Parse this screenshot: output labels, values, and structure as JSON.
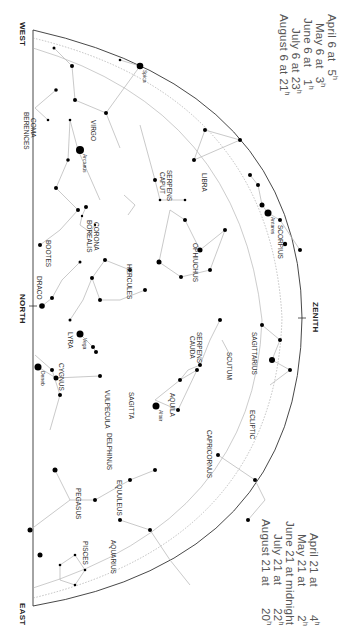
{
  "times_top": [
    {
      "label": "April 6 at",
      "value": "5",
      "unit": "h"
    },
    {
      "label": "May 6 at",
      "value": "3",
      "unit": "h"
    },
    {
      "label": "June 6 at",
      "value": "1",
      "unit": "h"
    },
    {
      "label": "July 6 at",
      "value": "23",
      "unit": "h"
    },
    {
      "label": "August 6 at",
      "value": "21",
      "unit": "h"
    }
  ],
  "times_bottom": [
    {
      "label": "April 21 at",
      "value": "4",
      "unit": "h"
    },
    {
      "label": "May 21 at",
      "value": "2",
      "unit": "h"
    },
    {
      "label": "June 21 at midnight",
      "value": "",
      "unit": ""
    },
    {
      "label": "July 21 at",
      "value": "22",
      "unit": "h"
    },
    {
      "label": "August 21 at",
      "value": "20",
      "unit": "h"
    }
  ],
  "compass": {
    "west": "WEST",
    "north": "NORTH",
    "east": "EAST",
    "zenith": "ZENITH"
  },
  "constellations": [
    {
      "name": "COMA",
      "x": 37,
      "y": 118
    },
    {
      "name": "BERENICES",
      "x": 30,
      "y": 112
    },
    {
      "name": "VIRGO",
      "x": 97,
      "y": 120
    },
    {
      "name": "BOOTES",
      "x": 52,
      "y": 240
    },
    {
      "name": "SERPENS",
      "x": 173,
      "y": 170
    },
    {
      "name": "CAPUT",
      "x": 166,
      "y": 172
    },
    {
      "name": "LIBRA",
      "x": 208,
      "y": 173
    },
    {
      "name": "CORONA",
      "x": 100,
      "y": 222
    },
    {
      "name": "BOREALIS",
      "x": 93,
      "y": 220
    },
    {
      "name": "OPHIUCHUS",
      "x": 199,
      "y": 243
    },
    {
      "name": "SCORPIUS",
      "x": 284,
      "y": 225
    },
    {
      "name": "HERCULES",
      "x": 133,
      "y": 264
    },
    {
      "name": "DRACO",
      "x": 43,
      "y": 276
    },
    {
      "name": "SERPENS",
      "x": 203,
      "y": 332
    },
    {
      "name": "CAUDA",
      "x": 196,
      "y": 336
    },
    {
      "name": "SAGITTARIUS",
      "x": 258,
      "y": 332
    },
    {
      "name": "SCUTUM",
      "x": 233,
      "y": 352
    },
    {
      "name": "LYRA",
      "x": 74,
      "y": 332
    },
    {
      "name": "CYGNUS",
      "x": 65,
      "y": 363
    },
    {
      "name": "VULPECULA",
      "x": 111,
      "y": 390
    },
    {
      "name": "SAGITTA",
      "x": 135,
      "y": 392
    },
    {
      "name": "AQUILA",
      "x": 176,
      "y": 393
    },
    {
      "name": "ECLIPTIC",
      "x": 256,
      "y": 410
    },
    {
      "name": "CAPRICORNUS",
      "x": 213,
      "y": 430
    },
    {
      "name": "DELPHINUS",
      "x": 113,
      "y": 433
    },
    {
      "name": "EQUULEUS",
      "x": 123,
      "y": 480
    },
    {
      "name": "PEGASUS",
      "x": 82,
      "y": 488
    },
    {
      "name": "AQUARIUS",
      "x": 117,
      "y": 540
    },
    {
      "name": "PISCES",
      "x": 89,
      "y": 541
    }
  ],
  "stars": [
    {
      "name": "Spica",
      "x": 140,
      "y": 66
    },
    {
      "name": "Arcturus",
      "x": 80,
      "y": 150
    },
    {
      "name": "Antares",
      "x": 268,
      "y": 213
    },
    {
      "name": "Vega",
      "x": 80,
      "y": 334
    },
    {
      "name": "Deneb",
      "x": 38,
      "y": 367
    },
    {
      "name": "Altair",
      "x": 156,
      "y": 406
    }
  ],
  "ecliptic_degrees": [
    "180°",
    "190°",
    "200°",
    "210°",
    "220°",
    "230°",
    "240°",
    "250°",
    "260°",
    "270°",
    "280°",
    "290°",
    "300°",
    "310°",
    "320°",
    "330°",
    "340°",
    "350°"
  ]
}
